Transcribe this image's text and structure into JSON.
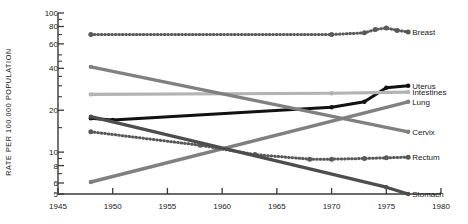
{
  "chart_data": {
    "type": "line",
    "title": "",
    "xlabel": "",
    "ylabel": "RATE PER 100,000 POPULATION",
    "yscale": "log",
    "ylim": [
      5,
      100
    ],
    "xlim": [
      1945,
      1980
    ],
    "ytick_labels": [
      "100",
      "80",
      "60",
      "40",
      "20",
      "10",
      "8",
      "6",
      "5"
    ],
    "ytick_values": [
      100,
      80,
      60,
      40,
      20,
      10,
      8,
      6,
      5
    ],
    "yminor_ticks": [
      90,
      70,
      50,
      45,
      35,
      30,
      25,
      15,
      9,
      7
    ],
    "xtick_labels": [
      "1945",
      "1950",
      "1955",
      "1960",
      "1965",
      "1970",
      "1975",
      "1980"
    ],
    "xtick_values": [
      1945,
      1950,
      1955,
      1960,
      1965,
      1970,
      1975,
      1980
    ],
    "grid": false,
    "legend_position": "right-inline",
    "series": [
      {
        "name": "Breast",
        "label": "Breast",
        "color": "#595959",
        "style": "dotted",
        "width": 3.0,
        "x": [
          1948,
          1970,
          1973,
          1974,
          1975,
          1976,
          1977
        ],
        "values": [
          70,
          70,
          72,
          76,
          78,
          75,
          73
        ]
      },
      {
        "name": "Uterus",
        "label": "Uterus",
        "color": "#111111",
        "style": "solid",
        "width": 3.0,
        "x": [
          1948,
          1950,
          1970,
          1973,
          1975,
          1977
        ],
        "values": [
          17.5,
          17,
          21,
          23,
          29,
          30
        ]
      },
      {
        "name": "Intestines",
        "label": "Intestines",
        "color": "#b3b3b3",
        "style": "solid",
        "width": 3.2,
        "x": [
          1948,
          1970,
          1977
        ],
        "values": [
          26,
          26.5,
          27
        ]
      },
      {
        "name": "Lung",
        "label": "Lung",
        "color": "#808080",
        "style": "solid",
        "width": 3.4,
        "x": [
          1948,
          1977
        ],
        "values": [
          6.1,
          23
        ]
      },
      {
        "name": "Cervix",
        "label": "Cervix",
        "color": "#808080",
        "style": "solid",
        "width": 3.4,
        "x": [
          1948,
          1977
        ],
        "values": [
          41,
          14
        ]
      },
      {
        "name": "Rectum",
        "label": "Rectum",
        "color": "#595959",
        "style": "dotted",
        "width": 3.0,
        "x": [
          1948,
          1958,
          1963,
          1968,
          1970,
          1973,
          1975,
          1977
        ],
        "values": [
          14,
          11.2,
          9.6,
          8.9,
          8.9,
          9.0,
          9.1,
          9.2
        ]
      },
      {
        "name": "Stomach",
        "label": "Stomach",
        "color": "#4d4d4d",
        "style": "solid",
        "width": 3.2,
        "x": [
          1948,
          1975,
          1977
        ],
        "values": [
          18,
          5.6,
          5.0
        ]
      }
    ]
  }
}
